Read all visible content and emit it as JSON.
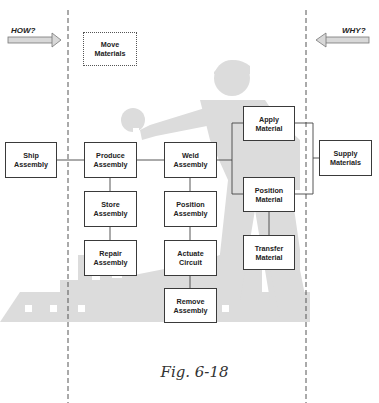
{
  "diagram": {
    "type": "FAST function diagram",
    "directions": {
      "how_label": "HOW?",
      "why_label": "WHY?"
    },
    "scope_function": {
      "label_line1": "Move",
      "label_line2": "Materials"
    },
    "functions": {
      "ship_assembly": {
        "line1": "Ship",
        "line2": "Assembly"
      },
      "produce_assembly": {
        "line1": "Produce",
        "line2": "Assembly"
      },
      "store_assembly": {
        "line1": "Store",
        "line2": "Assembly"
      },
      "repair_assembly": {
        "line1": "Repair",
        "line2": "Assembly"
      },
      "weld_assembly": {
        "line1": "Weld",
        "line2": "Assembly"
      },
      "position_assembly": {
        "line1": "Position",
        "line2": "Assembly"
      },
      "actuate_circuit": {
        "line1": "Actuate",
        "line2": "Circuit"
      },
      "remove_assembly": {
        "line1": "Remove",
        "line2": "Assembly"
      },
      "apply_material": {
        "line1": "Apply",
        "line2": "Material"
      },
      "position_material": {
        "line1": "Position",
        "line2": "Material"
      },
      "transfer_material": {
        "line1": "Transfer",
        "line2": "Material"
      },
      "supply_materials": {
        "line1": "Supply",
        "line2": "Materials"
      }
    },
    "caption": "Fig. 6-18",
    "colors": {
      "background_art": "#dcdcdc",
      "box_border": "#3a3a3a",
      "connector": "#444444",
      "scope_line": "#555555"
    }
  }
}
